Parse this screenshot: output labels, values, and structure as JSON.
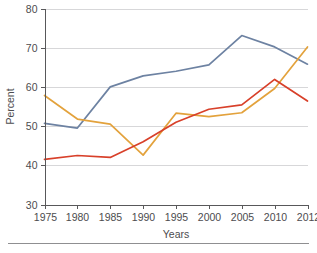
{
  "chart_data": {
    "type": "line",
    "title": "",
    "xlabel": "Years",
    "ylabel": "Percent",
    "categories": [
      "1975",
      "1980",
      "1985",
      "1990",
      "1995",
      "2000",
      "2005",
      "2010",
      "2012"
    ],
    "x": [
      1975,
      1980,
      1985,
      1990,
      1995,
      2000,
      2005,
      2010,
      2012
    ],
    "xlim": [
      1975,
      2012
    ],
    "ylim": [
      30,
      80
    ],
    "yticks": [
      30,
      40,
      50,
      60,
      70,
      80
    ],
    "ytick_labels": [
      "30",
      "40",
      "50",
      "60",
      "70",
      "80"
    ],
    "xticks": [
      1975,
      1980,
      1985,
      1990,
      1995,
      2000,
      2005,
      2010,
      2012
    ],
    "grid": "horizontal",
    "legend": "none",
    "series": [
      {
        "name": "blue-series",
        "color": "#6d82a2",
        "values": [
          50.7,
          49.5,
          60.0,
          62.8,
          64.0,
          65.6,
          73.1,
          70.2,
          65.8
        ]
      },
      {
        "name": "orange-series",
        "color": "#e3a23c",
        "values": [
          57.8,
          51.8,
          50.5,
          42.6,
          53.3,
          52.4,
          53.4,
          59.6,
          70.2
        ]
      },
      {
        "name": "red-series",
        "color": "#d8402a",
        "values": [
          41.5,
          42.5,
          42.0,
          46.0,
          51.0,
          54.3,
          55.4,
          61.9,
          56.4
        ]
      }
    ]
  },
  "axes": {
    "y_label": "Percent",
    "x_label": "Years"
  },
  "colors": {
    "blue": "#6d82a2",
    "orange": "#e3a23c",
    "red": "#d8402a",
    "grid": "#d7d7d9",
    "axis": "#58585a",
    "text": "#4c4c4e",
    "background": "#ffffff"
  }
}
